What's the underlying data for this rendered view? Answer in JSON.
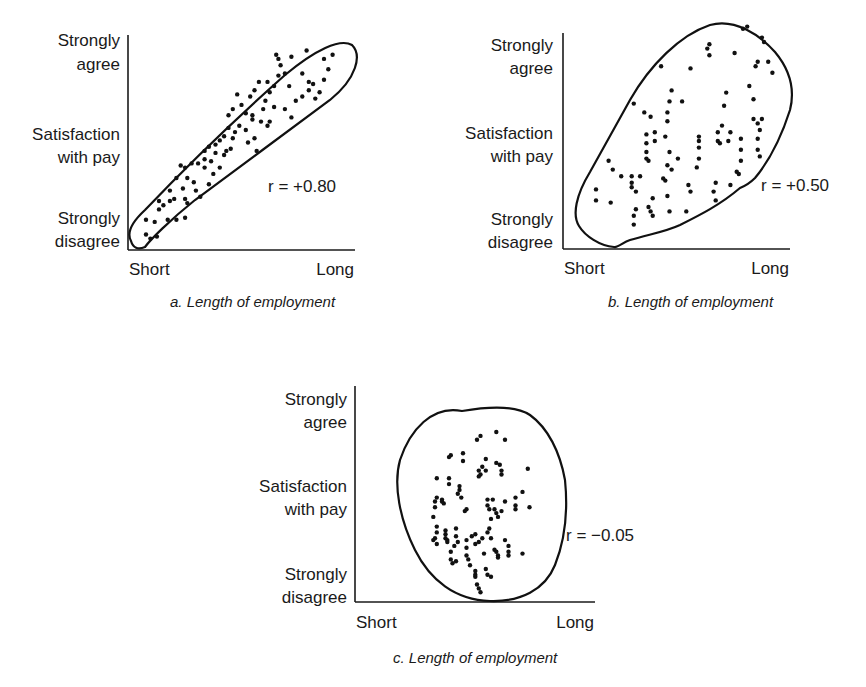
{
  "chart_data": [
    {
      "type": "scatter",
      "panel": "a",
      "caption": "a. Length of employment",
      "xlabel": "Length of employment",
      "ylabel": "Satisfaction with pay",
      "x_tick_labels": [
        "Short",
        "Long"
      ],
      "y_tick_labels": [
        "Strongly disagree",
        "Satisfaction with pay",
        "Strongly agree"
      ],
      "xlim": [
        0,
        1
      ],
      "ylim": [
        0,
        1
      ],
      "annotation": "r = +0.80",
      "r": 0.8,
      "points": [
        [
          0.06,
          0.06
        ],
        [
          0.08,
          0.04
        ],
        [
          0.11,
          0.05
        ],
        [
          0.1,
          0.12
        ],
        [
          0.06,
          0.13
        ],
        [
          0.12,
          0.18
        ],
        [
          0.16,
          0.13
        ],
        [
          0.2,
          0.13
        ],
        [
          0.24,
          0.14
        ],
        [
          0.25,
          0.21
        ],
        [
          0.12,
          0.22
        ],
        [
          0.17,
          0.22
        ],
        [
          0.24,
          0.23
        ],
        [
          0.23,
          0.28
        ],
        [
          0.17,
          0.27
        ],
        [
          0.2,
          0.33
        ],
        [
          0.25,
          0.33
        ],
        [
          0.28,
          0.31
        ],
        [
          0.24,
          0.38
        ],
        [
          0.27,
          0.4
        ],
        [
          0.22,
          0.39
        ],
        [
          0.3,
          0.4
        ],
        [
          0.33,
          0.42
        ],
        [
          0.33,
          0.46
        ],
        [
          0.36,
          0.41
        ],
        [
          0.35,
          0.48
        ],
        [
          0.38,
          0.49
        ],
        [
          0.42,
          0.44
        ],
        [
          0.4,
          0.38
        ],
        [
          0.37,
          0.35
        ],
        [
          0.33,
          0.38
        ],
        [
          0.4,
          0.51
        ],
        [
          0.42,
          0.53
        ],
        [
          0.43,
          0.46
        ],
        [
          0.46,
          0.52
        ],
        [
          0.44,
          0.57
        ],
        [
          0.47,
          0.55
        ],
        [
          0.52,
          0.56
        ],
        [
          0.53,
          0.5
        ],
        [
          0.56,
          0.52
        ],
        [
          0.57,
          0.46
        ],
        [
          0.59,
          0.6
        ],
        [
          0.55,
          0.61
        ],
        [
          0.52,
          0.64
        ],
        [
          0.5,
          0.68
        ],
        [
          0.46,
          0.66
        ],
        [
          0.44,
          0.63
        ],
        [
          0.48,
          0.73
        ],
        [
          0.54,
          0.72
        ],
        [
          0.56,
          0.75
        ],
        [
          0.61,
          0.7
        ],
        [
          0.63,
          0.74
        ],
        [
          0.58,
          0.79
        ],
        [
          0.62,
          0.79
        ],
        [
          0.65,
          0.77
        ],
        [
          0.67,
          0.82
        ],
        [
          0.7,
          0.83
        ],
        [
          0.72,
          0.77
        ],
        [
          0.7,
          0.66
        ],
        [
          0.73,
          0.62
        ],
        [
          0.75,
          0.7
        ],
        [
          0.78,
          0.72
        ],
        [
          0.81,
          0.75
        ],
        [
          0.83,
          0.78
        ],
        [
          0.86,
          0.74
        ],
        [
          0.88,
          0.8
        ],
        [
          0.9,
          0.85
        ],
        [
          0.88,
          0.9
        ],
        [
          0.92,
          0.92
        ],
        [
          0.68,
          0.87
        ],
        [
          0.66,
          0.92
        ],
        [
          0.67,
          0.9
        ],
        [
          0.73,
          0.91
        ],
        [
          0.78,
          0.83
        ],
        [
          0.81,
          0.79
        ],
        [
          0.84,
          0.71
        ],
        [
          0.62,
          0.58
        ],
        [
          0.63,
          0.6
        ],
        [
          0.6,
          0.66
        ],
        [
          0.65,
          0.67
        ],
        [
          0.8,
          0.94
        ],
        [
          0.55,
          0.63
        ],
        [
          0.49,
          0.58
        ],
        [
          0.45,
          0.47
        ],
        [
          0.38,
          0.45
        ],
        [
          0.35,
          0.3
        ],
        [
          0.31,
          0.24
        ],
        [
          0.29,
          0.27
        ],
        [
          0.19,
          0.23
        ],
        [
          0.14,
          0.2
        ]
      ]
    },
    {
      "type": "scatter",
      "panel": "b",
      "caption": "b. Length of employment",
      "xlabel": "Length of employment",
      "ylabel": "Satisfaction with pay",
      "x_tick_labels": [
        "Short",
        "Long"
      ],
      "y_tick_labels": [
        "Strongly disagree",
        "Satisfaction with pay",
        "Strongly agree"
      ],
      "xlim": [
        0,
        1
      ],
      "ylim": [
        0,
        1
      ],
      "annotation": "r = +0.50",
      "r": 0.5,
      "points": [
        [
          0.1,
          0.23
        ],
        [
          0.1,
          0.18
        ],
        [
          0.17,
          0.17
        ],
        [
          0.16,
          0.36
        ],
        [
          0.18,
          0.32
        ],
        [
          0.22,
          0.29
        ],
        [
          0.27,
          0.29
        ],
        [
          0.27,
          0.26
        ],
        [
          0.27,
          0.24
        ],
        [
          0.29,
          0.22
        ],
        [
          0.29,
          0.14
        ],
        [
          0.28,
          0.11
        ],
        [
          0.28,
          0.07
        ],
        [
          0.36,
          0.13
        ],
        [
          0.37,
          0.11
        ],
        [
          0.37,
          0.19
        ],
        [
          0.35,
          0.15
        ],
        [
          0.44,
          0.2
        ],
        [
          0.45,
          0.13
        ],
        [
          0.53,
          0.13
        ],
        [
          0.54,
          0.25
        ],
        [
          0.44,
          0.34
        ],
        [
          0.46,
          0.32
        ],
        [
          0.43,
          0.27
        ],
        [
          0.42,
          0.28
        ],
        [
          0.34,
          0.37
        ],
        [
          0.35,
          0.36
        ],
        [
          0.34,
          0.4
        ],
        [
          0.34,
          0.44
        ],
        [
          0.34,
          0.48
        ],
        [
          0.38,
          0.45
        ],
        [
          0.38,
          0.49
        ],
        [
          0.43,
          0.47
        ],
        [
          0.44,
          0.54
        ],
        [
          0.44,
          0.58
        ],
        [
          0.45,
          0.63
        ],
        [
          0.46,
          0.68
        ],
        [
          0.51,
          0.63
        ],
        [
          0.36,
          0.56
        ],
        [
          0.33,
          0.58
        ],
        [
          0.28,
          0.62
        ],
        [
          0.41,
          0.79
        ],
        [
          0.55,
          0.78
        ],
        [
          0.63,
          0.87
        ],
        [
          0.64,
          0.84
        ],
        [
          0.64,
          0.89
        ],
        [
          0.76,
          0.85
        ],
        [
          0.8,
          0.96
        ],
        [
          0.82,
          0.97
        ],
        [
          0.89,
          0.92
        ],
        [
          0.9,
          0.9
        ],
        [
          0.92,
          0.81
        ],
        [
          0.94,
          0.76
        ],
        [
          0.86,
          0.79
        ],
        [
          0.87,
          0.81
        ],
        [
          0.85,
          0.64
        ],
        [
          0.85,
          0.55
        ],
        [
          0.88,
          0.5
        ],
        [
          0.87,
          0.53
        ],
        [
          0.89,
          0.55
        ],
        [
          0.87,
          0.46
        ],
        [
          0.87,
          0.41
        ],
        [
          0.88,
          0.38
        ],
        [
          0.79,
          0.46
        ],
        [
          0.79,
          0.41
        ],
        [
          0.79,
          0.36
        ],
        [
          0.77,
          0.31
        ],
        [
          0.78,
          0.3
        ],
        [
          0.74,
          0.25
        ],
        [
          0.67,
          0.26
        ],
        [
          0.66,
          0.22
        ],
        [
          0.67,
          0.18
        ],
        [
          0.58,
          0.33
        ],
        [
          0.59,
          0.37
        ],
        [
          0.59,
          0.42
        ],
        [
          0.59,
          0.45
        ],
        [
          0.59,
          0.47
        ],
        [
          0.68,
          0.49
        ],
        [
          0.69,
          0.44
        ],
        [
          0.7,
          0.52
        ],
        [
          0.71,
          0.61
        ],
        [
          0.72,
          0.67
        ],
        [
          0.74,
          0.49
        ],
        [
          0.68,
          0.45
        ],
        [
          0.73,
          0.45
        ],
        [
          0.55,
          0.22
        ],
        [
          0.83,
          0.7
        ],
        [
          0.45,
          0.4
        ],
        [
          0.49,
          0.37
        ],
        [
          0.31,
          0.29
        ]
      ]
    },
    {
      "type": "scatter",
      "panel": "c",
      "caption": "c. Length of employment",
      "xlabel": "Length of employment",
      "ylabel": "Satisfaction with pay",
      "x_tick_labels": [
        "Short",
        "Long"
      ],
      "y_tick_labels": [
        "Strongly disagree",
        "Satisfaction with pay",
        "Strongly agree"
      ],
      "xlim": [
        0,
        1
      ],
      "ylim": [
        0,
        1
      ],
      "annotation": "r = -0.05",
      "r": -0.05,
      "points": [
        [
          0.5,
          0.84
        ],
        [
          0.48,
          0.82
        ],
        [
          0.59,
          0.86
        ],
        [
          0.64,
          0.82
        ],
        [
          0.33,
          0.74
        ],
        [
          0.32,
          0.73
        ],
        [
          0.4,
          0.75
        ],
        [
          0.4,
          0.71
        ],
        [
          0.51,
          0.68
        ],
        [
          0.49,
          0.66
        ],
        [
          0.5,
          0.64
        ],
        [
          0.49,
          0.63
        ],
        [
          0.53,
          0.72
        ],
        [
          0.59,
          0.7
        ],
        [
          0.61,
          0.69
        ],
        [
          0.62,
          0.66
        ],
        [
          0.62,
          0.64
        ],
        [
          0.53,
          0.66
        ],
        [
          0.77,
          0.67
        ],
        [
          0.25,
          0.62
        ],
        [
          0.32,
          0.62
        ],
        [
          0.32,
          0.59
        ],
        [
          0.38,
          0.58
        ],
        [
          0.38,
          0.56
        ],
        [
          0.37,
          0.54
        ],
        [
          0.39,
          0.52
        ],
        [
          0.25,
          0.52
        ],
        [
          0.24,
          0.5
        ],
        [
          0.24,
          0.47
        ],
        [
          0.28,
          0.51
        ],
        [
          0.28,
          0.5
        ],
        [
          0.29,
          0.49
        ],
        [
          0.42,
          0.46
        ],
        [
          0.41,
          0.45
        ],
        [
          0.54,
          0.51
        ],
        [
          0.54,
          0.48
        ],
        [
          0.55,
          0.46
        ],
        [
          0.57,
          0.51
        ],
        [
          0.58,
          0.46
        ],
        [
          0.59,
          0.44
        ],
        [
          0.56,
          0.41
        ],
        [
          0.6,
          0.42
        ],
        [
          0.62,
          0.45
        ],
        [
          0.64,
          0.5
        ],
        [
          0.7,
          0.52
        ],
        [
          0.7,
          0.48
        ],
        [
          0.7,
          0.46
        ],
        [
          0.74,
          0.55
        ],
        [
          0.78,
          0.47
        ],
        [
          0.23,
          0.42
        ],
        [
          0.25,
          0.37
        ],
        [
          0.25,
          0.34
        ],
        [
          0.24,
          0.31
        ],
        [
          0.23,
          0.3
        ],
        [
          0.25,
          0.28
        ],
        [
          0.3,
          0.35
        ],
        [
          0.3,
          0.33
        ],
        [
          0.3,
          0.31
        ],
        [
          0.31,
          0.3
        ],
        [
          0.31,
          0.29
        ],
        [
          0.36,
          0.36
        ],
        [
          0.36,
          0.32
        ],
        [
          0.37,
          0.29
        ],
        [
          0.35,
          0.27
        ],
        [
          0.33,
          0.24
        ],
        [
          0.33,
          0.2
        ],
        [
          0.34,
          0.18
        ],
        [
          0.36,
          0.19
        ],
        [
          0.42,
          0.26
        ],
        [
          0.42,
          0.3
        ],
        [
          0.45,
          0.32
        ],
        [
          0.47,
          0.28
        ],
        [
          0.47,
          0.33
        ],
        [
          0.49,
          0.29
        ],
        [
          0.51,
          0.31
        ],
        [
          0.54,
          0.34
        ],
        [
          0.55,
          0.36
        ],
        [
          0.56,
          0.31
        ],
        [
          0.58,
          0.25
        ],
        [
          0.59,
          0.24
        ],
        [
          0.6,
          0.22
        ],
        [
          0.64,
          0.3
        ],
        [
          0.66,
          0.27
        ],
        [
          0.66,
          0.24
        ],
        [
          0.66,
          0.22
        ],
        [
          0.74,
          0.23
        ],
        [
          0.47,
          0.14
        ],
        [
          0.47,
          0.12
        ],
        [
          0.47,
          0.11
        ],
        [
          0.48,
          0.07
        ],
        [
          0.49,
          0.05
        ],
        [
          0.5,
          0.03
        ],
        [
          0.53,
          0.15
        ],
        [
          0.54,
          0.12
        ],
        [
          0.56,
          0.11
        ],
        [
          0.42,
          0.22
        ],
        [
          0.43,
          0.2
        ],
        [
          0.52,
          0.23
        ],
        [
          0.6,
          0.21
        ],
        [
          0.44,
          0.17
        ]
      ]
    }
  ],
  "labels": {
    "y_top": [
      "Strongly",
      "agree"
    ],
    "y_mid": [
      "Satisfaction",
      "with pay"
    ],
    "y_bottom": [
      "Strongly",
      "disagree"
    ],
    "x_left": "Short",
    "x_right": "Long"
  }
}
